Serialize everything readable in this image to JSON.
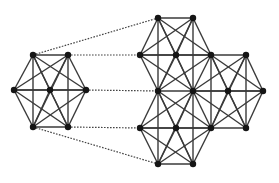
{
  "diagram": {
    "colors": {
      "edge": "#3a3a3a",
      "node": "#151515",
      "mapping": "#444444",
      "background": "#ffffff"
    },
    "node_radius": 3.2,
    "left_graph": {
      "nodes": [
        {
          "id": "L_TL",
          "x": 33,
          "y": 55
        },
        {
          "id": "L_TR",
          "x": 68,
          "y": 55
        },
        {
          "id": "L_L",
          "x": 14,
          "y": 90
        },
        {
          "id": "L_C",
          "x": 50,
          "y": 90
        },
        {
          "id": "L_R",
          "x": 86,
          "y": 90
        },
        {
          "id": "L_BL",
          "x": 33,
          "y": 127
        },
        {
          "id": "L_BR",
          "x": 68,
          "y": 127
        }
      ],
      "clusters": [
        {
          "outer": [
            "L_TL",
            "L_TR",
            "L_R",
            "L_BR",
            "L_BL",
            "L_L"
          ],
          "center": "L_C"
        }
      ]
    },
    "right_graph": {
      "nodes": [
        {
          "id": "A1",
          "x": 158,
          "y": 18
        },
        {
          "id": "A2",
          "x": 193,
          "y": 18
        },
        {
          "id": "B1",
          "x": 140,
          "y": 55
        },
        {
          "id": "B2",
          "x": 176,
          "y": 55
        },
        {
          "id": "B3",
          "x": 211,
          "y": 55
        },
        {
          "id": "B4",
          "x": 246,
          "y": 55
        },
        {
          "id": "C1",
          "x": 158,
          "y": 91
        },
        {
          "id": "C2",
          "x": 193,
          "y": 91
        },
        {
          "id": "C3",
          "x": 228,
          "y": 91
        },
        {
          "id": "C4",
          "x": 263,
          "y": 91
        },
        {
          "id": "D1",
          "x": 140,
          "y": 128
        },
        {
          "id": "D2",
          "x": 176,
          "y": 128
        },
        {
          "id": "D3",
          "x": 211,
          "y": 128
        },
        {
          "id": "D4",
          "x": 246,
          "y": 128
        },
        {
          "id": "E1",
          "x": 158,
          "y": 164
        },
        {
          "id": "E2",
          "x": 193,
          "y": 164
        }
      ],
      "clusters": [
        {
          "outer": [
            "A1",
            "A2",
            "B3",
            "C2",
            "C1",
            "B1"
          ],
          "center": "B2"
        },
        {
          "outer": [
            "C1",
            "C2",
            "D3",
            "E2",
            "E1",
            "D1"
          ],
          "center": "D2"
        },
        {
          "outer": [
            "B3",
            "B4",
            "C4",
            "D4",
            "D3",
            "C2"
          ],
          "center": "C3"
        }
      ]
    },
    "mappings": [
      {
        "from": "L_TL",
        "to": "A1"
      },
      {
        "from": "L_TR",
        "to": "B1"
      },
      {
        "from": "L_R",
        "to": "C1"
      },
      {
        "from": "L_BR",
        "to": "D1"
      },
      {
        "from": "L_BL",
        "to": "E1"
      }
    ]
  }
}
